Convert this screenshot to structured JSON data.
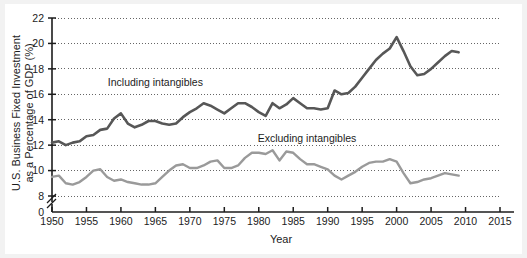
{
  "chart_data": {
    "type": "line",
    "title": "",
    "xlabel": "Year",
    "ylabel": "U.S. Business Fixed Investment as a Percentage of GDP (%)",
    "xlim": [
      1950,
      2015
    ],
    "ylim": [
      8,
      22
    ],
    "y_axis_break": true,
    "y_break_base_label": "0",
    "grid": true,
    "grid_style": "dotted-horizontal",
    "legend_position": "inline-annotations",
    "xticks": [
      1950,
      1955,
      1960,
      1965,
      1970,
      1975,
      1980,
      1985,
      1990,
      1995,
      2000,
      2005,
      2010,
      2015
    ],
    "xtick_labels": [
      "1950",
      "1955",
      "1960",
      "1965",
      "1970",
      "1975",
      "1980",
      "1985",
      "1990",
      "1995",
      "2000",
      "2005",
      "2010",
      "2015"
    ],
    "yticks": [
      0,
      8,
      10,
      12,
      14,
      16,
      18,
      20,
      22
    ],
    "ytick_labels": [
      "0",
      "8",
      "10",
      "12",
      "14",
      "16",
      "18",
      "20",
      "22"
    ],
    "x": [
      1950,
      1951,
      1952,
      1953,
      1954,
      1955,
      1956,
      1957,
      1958,
      1959,
      1960,
      1961,
      1962,
      1963,
      1964,
      1965,
      1966,
      1967,
      1968,
      1969,
      1970,
      1971,
      1972,
      1973,
      1974,
      1975,
      1976,
      1977,
      1978,
      1979,
      1980,
      1981,
      1982,
      1983,
      1984,
      1985,
      1986,
      1987,
      1988,
      1989,
      1990,
      1991,
      1992,
      1993,
      1994,
      1995,
      1996,
      1997,
      1998,
      1999,
      2000,
      2001,
      2002,
      2003,
      2004,
      2005,
      2006,
      2007,
      2008,
      2009
    ],
    "series": [
      {
        "name": "Including intangibles",
        "color": "#575757",
        "label_text": "Including intangibles",
        "values": [
          12.2,
          12.3,
          12.0,
          12.2,
          12.3,
          12.7,
          12.8,
          13.2,
          13.3,
          14.1,
          14.5,
          13.7,
          13.4,
          13.6,
          13.9,
          13.9,
          13.7,
          13.6,
          13.7,
          14.2,
          14.6,
          14.9,
          15.3,
          15.1,
          14.8,
          14.5,
          14.9,
          15.3,
          15.3,
          15.0,
          14.6,
          14.3,
          15.3,
          14.9,
          15.2,
          15.7,
          15.3,
          14.9,
          14.9,
          14.8,
          14.9,
          16.3,
          16.0,
          16.1,
          16.6,
          17.3,
          18.0,
          18.7,
          19.2,
          19.6,
          20.5,
          19.4,
          18.2,
          17.5,
          17.6,
          18.0,
          18.5,
          19.0,
          19.4,
          19.3
        ]
      },
      {
        "name": "Excluding intangibles",
        "color": "#9a9a9a",
        "label_text": "Excluding intangibles",
        "values": [
          9.5,
          9.6,
          9.0,
          8.9,
          9.1,
          9.5,
          10.0,
          10.1,
          9.5,
          9.2,
          9.3,
          9.1,
          9.0,
          8.9,
          8.9,
          9.0,
          9.5,
          10.0,
          10.4,
          10.5,
          10.2,
          10.2,
          10.4,
          10.7,
          10.8,
          10.2,
          10.2,
          10.4,
          11.0,
          11.4,
          11.4,
          11.3,
          11.6,
          10.8,
          11.5,
          11.4,
          10.9,
          10.5,
          10.5,
          10.3,
          10.1,
          9.6,
          9.3,
          9.6,
          9.9,
          10.3,
          10.6,
          10.7,
          10.7,
          10.9,
          10.7,
          9.8,
          9.0,
          9.1,
          9.3,
          9.4,
          9.6,
          9.8,
          9.7,
          9.6
        ]
      }
    ],
    "annotations": [
      {
        "text": "Including intangibles",
        "x": 1965,
        "y": 17.0
      },
      {
        "text": "Excluding intangibles",
        "x": 1987,
        "y": 12.6
      }
    ]
  },
  "axes": {
    "x_title": "Year",
    "y_title_line1": "U.S. Business Fixed Investment",
    "y_title_line2": "as a Percentage of GDP (%)"
  }
}
